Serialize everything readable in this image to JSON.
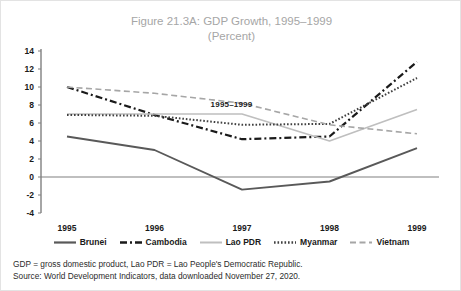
{
  "title": {
    "line1": "Figure 21.3A: GDP Growth, 1995–1999",
    "line2": "(Percent)"
  },
  "annotation": "1995–1999",
  "notes": {
    "definitions": "GDP = gross domestic product, Lao PDR = Lao People's Democratic Republic.",
    "source": "Source: World Development Indicators, data downloaded November 27, 2020."
  },
  "colors": {
    "brunei": "#595959",
    "cambodia": "#1a1a1a",
    "lao_pdr": "#bfbfbf",
    "myanmar": "#404040",
    "vietnam": "#a6a6a6",
    "axis": "#808080",
    "title": "#a6a6a6"
  },
  "chart_data": {
    "type": "line",
    "title": "Figure 21.3A: GDP Growth, 1995–1999 (Percent)",
    "xlabel": "",
    "ylabel": "Percent",
    "grid": false,
    "legend_position": "bottom",
    "categories": [
      "1995",
      "1996",
      "1997",
      "1998",
      "1999"
    ],
    "x_ticks": [
      "1995",
      "1996",
      "1997",
      "1998",
      "1999"
    ],
    "y_ticks": [
      -4,
      -2,
      0,
      2,
      4,
      6,
      8,
      10,
      12,
      14
    ],
    "ylim": [
      -4,
      14
    ],
    "series": [
      {
        "name": "Brunei",
        "style": "solid",
        "color": "#595959",
        "values": [
          4.5,
          3.0,
          -1.4,
          -0.5,
          3.2
        ]
      },
      {
        "name": "Cambodia",
        "style": "dash-dot",
        "color": "#1a1a1a",
        "values": [
          10.0,
          6.9,
          4.2,
          4.5,
          12.8
        ]
      },
      {
        "name": "Lao PDR",
        "style": "solid-light",
        "color": "#bfbfbf",
        "values": [
          7.0,
          7.0,
          7.0,
          4.0,
          7.5
        ]
      },
      {
        "name": "Myanmar",
        "style": "dotted",
        "color": "#404040",
        "values": [
          6.9,
          6.8,
          5.8,
          5.9,
          11.0
        ]
      },
      {
        "name": "Vietnam",
        "style": "dashed",
        "color": "#a6a6a6",
        "values": [
          10.0,
          9.3,
          8.2,
          5.8,
          4.8
        ]
      }
    ]
  },
  "legend": [
    {
      "label": "Brunei"
    },
    {
      "label": "Cambodia"
    },
    {
      "label": "Lao PDR"
    },
    {
      "label": "Myanmar"
    },
    {
      "label": "Vietnam"
    }
  ]
}
